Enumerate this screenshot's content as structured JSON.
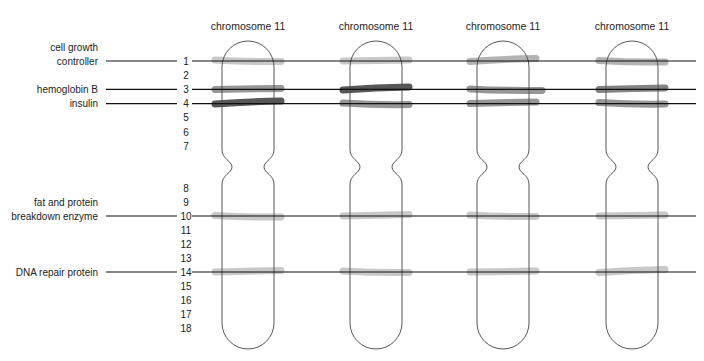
{
  "diagram": {
    "type": "chromosome-band-comparison",
    "band_colors": {
      "light": "#c2c2c2",
      "light-medium": "#ababab",
      "medium": "#8c8c8c",
      "medium-dark": "#767676",
      "dark": "#454545"
    },
    "row_numbers": [
      "1",
      "2",
      "3",
      "4",
      "5",
      "6",
      "7",
      "8",
      "9",
      "10",
      "11",
      "12",
      "13",
      "14",
      "15",
      "16",
      "17",
      "18"
    ],
    "gene_labels": [
      {
        "row": 1,
        "lines": [
          "cell growth",
          "controller"
        ]
      },
      {
        "row": 3,
        "lines": [
          "hemoglobin B"
        ]
      },
      {
        "row": 4,
        "lines": [
          "insulin"
        ]
      },
      {
        "row": 10,
        "lines": [
          "fat and protein",
          "breakdown enzyme"
        ]
      },
      {
        "row": 14,
        "lines": [
          "DNA repair protein"
        ]
      }
    ],
    "chromosomes": [
      {
        "title": "chromosome 11",
        "bands": [
          {
            "row": 1,
            "intensity": "light"
          },
          {
            "row": 3,
            "intensity": "medium"
          },
          {
            "row": 4,
            "intensity": "dark"
          },
          {
            "row": 10,
            "intensity": "light"
          },
          {
            "row": 14,
            "intensity": "light"
          }
        ]
      },
      {
        "title": "chromosome 11",
        "bands": [
          {
            "row": 1,
            "intensity": "light"
          },
          {
            "row": 3,
            "intensity": "dark"
          },
          {
            "row": 4,
            "intensity": "medium"
          },
          {
            "row": 10,
            "intensity": "light"
          },
          {
            "row": 14,
            "intensity": "light"
          }
        ]
      },
      {
        "title": "chromosome 11",
        "bands": [
          {
            "row": 1,
            "intensity": "light-medium"
          },
          {
            "row": 3,
            "intensity": "medium"
          },
          {
            "row": 4,
            "intensity": "medium"
          },
          {
            "row": 10,
            "intensity": "light"
          },
          {
            "row": 14,
            "intensity": "light"
          }
        ]
      },
      {
        "title": "chromosome 11",
        "bands": [
          {
            "row": 1,
            "intensity": "light-medium"
          },
          {
            "row": 3,
            "intensity": "medium-dark"
          },
          {
            "row": 4,
            "intensity": "medium"
          },
          {
            "row": 10,
            "intensity": "light"
          },
          {
            "row": 14,
            "intensity": "light"
          }
        ]
      }
    ]
  }
}
